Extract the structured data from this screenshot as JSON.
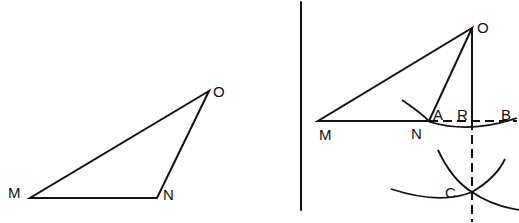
{
  "left_figure": {
    "points": {
      "M": {
        "label": "M",
        "x": 30,
        "y": 198
      },
      "N": {
        "label": "N",
        "x": 157,
        "y": 198
      },
      "O": {
        "label": "O",
        "x": 209,
        "y": 91
      }
    }
  },
  "right_figure": {
    "points": {
      "M": {
        "label": "M"
      },
      "N": {
        "label": "N"
      },
      "O": {
        "label": "O"
      },
      "A": {
        "label": "A"
      },
      "R": {
        "label": "R"
      },
      "B": {
        "label": "B"
      },
      "C": {
        "label": "C"
      }
    }
  },
  "colors": {
    "stroke": "#111111",
    "background": "#ffffff"
  }
}
